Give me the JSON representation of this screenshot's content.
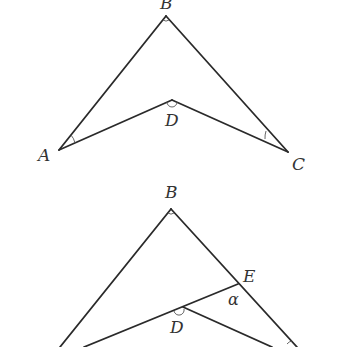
{
  "figures": [
    {
      "id": "figure-1",
      "points": {
        "A": {
          "label": "A",
          "x": 59,
          "y": 150
        },
        "B": {
          "label": "B",
          "x": 166,
          "y": 16
        },
        "C": {
          "label": "C",
          "x": 288,
          "y": 152
        },
        "D": {
          "label": "D",
          "x": 172,
          "y": 100
        }
      },
      "segments": [
        "AB",
        "BC",
        "AD",
        "DC"
      ],
      "angle_marks": [
        "A",
        "B",
        "C",
        "D"
      ]
    },
    {
      "id": "figure-2",
      "points": {
        "B": {
          "label": "B",
          "x": 171,
          "y": 209
        },
        "D": {
          "label": "D",
          "x": 178,
          "y": 310
        },
        "E": {
          "label": "E",
          "x": 238,
          "y": 284
        }
      },
      "segments": [
        "AB",
        "BC",
        "AE",
        "DC"
      ],
      "angle_label": "α",
      "angle_marks": [
        "B",
        "D",
        "C"
      ]
    }
  ]
}
